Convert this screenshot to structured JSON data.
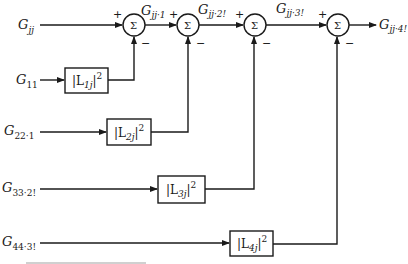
{
  "diagram": {
    "inputs": [
      {
        "id": "gjj",
        "base": "G",
        "sub": "jj",
        "subtail": ""
      },
      {
        "id": "g11",
        "base": "G",
        "sub": "11",
        "subtail": ""
      },
      {
        "id": "g22_1",
        "base": "G",
        "sub": "22·1",
        "subtail": ""
      },
      {
        "id": "g33_2",
        "base": "G",
        "sub": "33·2!",
        "subtail": ""
      },
      {
        "id": "g44_3",
        "base": "G",
        "sub": "44·3!",
        "subtail": ""
      }
    ],
    "blocks": [
      {
        "id": "l1",
        "text_open": "|L",
        "sub": "1j",
        "text_close": "|",
        "sup": "2"
      },
      {
        "id": "l2",
        "text_open": "|L",
        "sub": "2j",
        "text_close": "|",
        "sup": "2"
      },
      {
        "id": "l3",
        "text_open": "|L",
        "sub": "3j",
        "text_close": "|",
        "sup": "2"
      },
      {
        "id": "l4",
        "text_open": "|L",
        "sub": "4j",
        "text_close": "|",
        "sup": "2"
      }
    ],
    "summers": [
      {
        "id": "s1",
        "symbol": "Σ",
        "plus": "+",
        "minus": "−"
      },
      {
        "id": "s2",
        "symbol": "Σ",
        "plus": "+",
        "minus": "−"
      },
      {
        "id": "s3",
        "symbol": "Σ",
        "plus": "+",
        "minus": "−"
      },
      {
        "id": "s4",
        "symbol": "Σ",
        "plus": "+",
        "minus": "−"
      }
    ],
    "intermediate_signals": [
      {
        "id": "gjj_1",
        "base": "G",
        "sub": "jj·1"
      },
      {
        "id": "gjj_2",
        "base": "G",
        "sub": "jj·2!"
      },
      {
        "id": "gjj_3",
        "base": "G",
        "sub": "jj·3!"
      }
    ],
    "output": {
      "id": "gjj_4",
      "base": "G",
      "sub": "jj·4!"
    }
  },
  "colors": {
    "line": "#1a1a1a",
    "background": "#ffffff"
  }
}
